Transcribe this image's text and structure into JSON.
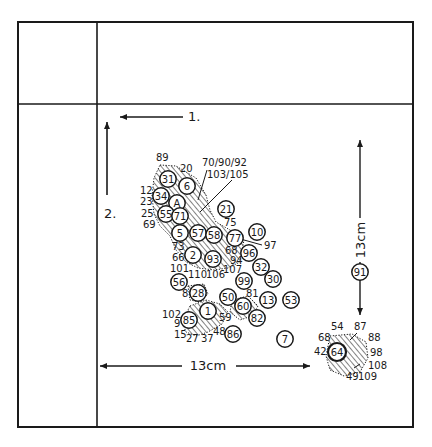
{
  "colors": {
    "ink": "#1a1a1a",
    "paper": "#ffffff"
  },
  "frame": {
    "outer": {
      "x": 18,
      "y": 22,
      "w": 395,
      "h": 405
    },
    "vertical_divider_x": 97,
    "horizontal_divider_y": 104
  },
  "axes": {
    "arrow_1": {
      "label": "1.",
      "x1": 183,
      "y1": 117,
      "x2": 120,
      "y2": 117,
      "lx": 188,
      "ly": 121
    },
    "arrow_2": {
      "label": "2.",
      "x1": 107,
      "y1": 195,
      "x2": 107,
      "y2": 122,
      "lx": 104,
      "ly": 218
    },
    "horizontal_scale": {
      "label": "13cm",
      "x1": 100,
      "x2": 310,
      "y": 366,
      "lx": 208,
      "ly": 370
    },
    "vertical_scale": {
      "label": "13cm",
      "x": 360,
      "y1": 140,
      "y2": 315,
      "lx": 365,
      "ly": 240
    }
  },
  "circled_points": [
    {
      "id": "31",
      "x": 168,
      "y": 179
    },
    {
      "id": "6",
      "x": 187,
      "y": 186
    },
    {
      "id": "34",
      "x": 161,
      "y": 196
    },
    {
      "id": "A",
      "x": 177,
      "y": 203
    },
    {
      "id": "55",
      "x": 166,
      "y": 214
    },
    {
      "id": "71",
      "x": 180,
      "y": 216
    },
    {
      "id": "21",
      "x": 226,
      "y": 209
    },
    {
      "id": "5",
      "x": 180,
      "y": 233
    },
    {
      "id": "57",
      "x": 198,
      "y": 233
    },
    {
      "id": "58",
      "x": 214,
      "y": 235
    },
    {
      "id": "77",
      "x": 235,
      "y": 238
    },
    {
      "id": "10",
      "x": 257,
      "y": 232
    },
    {
      "id": "2",
      "x": 193,
      "y": 255
    },
    {
      "id": "93",
      "x": 213,
      "y": 259
    },
    {
      "id": "96",
      "x": 249,
      "y": 253
    },
    {
      "id": "32",
      "x": 261,
      "y": 267
    },
    {
      "id": "30",
      "x": 273,
      "y": 279
    },
    {
      "id": "99",
      "x": 244,
      "y": 281
    },
    {
      "id": "56",
      "x": 179,
      "y": 282
    },
    {
      "id": "28",
      "x": 198,
      "y": 293
    },
    {
      "id": "50",
      "x": 228,
      "y": 297
    },
    {
      "id": "60",
      "x": 243,
      "y": 306
    },
    {
      "id": "13",
      "x": 268,
      "y": 300
    },
    {
      "id": "53",
      "x": 291,
      "y": 300
    },
    {
      "id": "1",
      "x": 208,
      "y": 311
    },
    {
      "id": "85",
      "x": 189,
      "y": 320
    },
    {
      "id": "82",
      "x": 257,
      "y": 318
    },
    {
      "id": "86",
      "x": 233,
      "y": 334
    },
    {
      "id": "7",
      "x": 285,
      "y": 339
    },
    {
      "id": "91",
      "x": 360,
      "y": 272
    },
    {
      "id": "64",
      "x": 337,
      "y": 352
    }
  ],
  "free_labels": [
    {
      "text": "89",
      "x": 156,
      "y": 161
    },
    {
      "text": "20",
      "x": 180,
      "y": 172
    },
    {
      "text": "70/90/92",
      "x": 202,
      "y": 166
    },
    {
      "text": "103/105",
      "x": 207,
      "y": 178
    },
    {
      "text": "12",
      "x": 140,
      "y": 194
    },
    {
      "text": "23",
      "x": 140,
      "y": 205
    },
    {
      "text": "25",
      "x": 141,
      "y": 217
    },
    {
      "text": "69",
      "x": 143,
      "y": 228
    },
    {
      "text": "75",
      "x": 224,
      "y": 226
    },
    {
      "text": "97",
      "x": 264,
      "y": 249
    },
    {
      "text": "73",
      "x": 172,
      "y": 250
    },
    {
      "text": "66",
      "x": 172,
      "y": 261
    },
    {
      "text": "68",
      "x": 225,
      "y": 254
    },
    {
      "text": "94",
      "x": 230,
      "y": 264
    },
    {
      "text": "101",
      "x": 170,
      "y": 272
    },
    {
      "text": "110",
      "x": 188,
      "y": 278
    },
    {
      "text": "106",
      "x": 206,
      "y": 278
    },
    {
      "text": "107",
      "x": 223,
      "y": 273
    },
    {
      "text": "8",
      "x": 182,
      "y": 297
    },
    {
      "text": "81",
      "x": 246,
      "y": 297
    },
    {
      "text": "102",
      "x": 162,
      "y": 318
    },
    {
      "text": "9",
      "x": 174,
      "y": 327
    },
    {
      "text": "59",
      "x": 219,
      "y": 321
    },
    {
      "text": "15",
      "x": 174,
      "y": 338
    },
    {
      "text": "27",
      "x": 186,
      "y": 342
    },
    {
      "text": "37",
      "x": 201,
      "y": 342
    },
    {
      "text": "48",
      "x": 213,
      "y": 335
    },
    {
      "text": "54",
      "x": 331,
      "y": 330
    },
    {
      "text": "87",
      "x": 354,
      "y": 330
    },
    {
      "text": "68",
      "x": 318,
      "y": 341
    },
    {
      "text": "88",
      "x": 368,
      "y": 341
    },
    {
      "text": "42",
      "x": 314,
      "y": 355
    },
    {
      "text": "98",
      "x": 370,
      "y": 356
    },
    {
      "text": "108",
      "x": 368,
      "y": 369
    },
    {
      "text": "49",
      "x": 346,
      "y": 380
    },
    {
      "text": "109",
      "x": 358,
      "y": 380
    }
  ],
  "leader_lines": [
    {
      "x1": 207,
      "y1": 170,
      "x2": 198,
      "y2": 200
    },
    {
      "x1": 232,
      "y1": 180,
      "x2": 200,
      "y2": 212
    },
    {
      "x1": 244,
      "y1": 240,
      "x2": 262,
      "y2": 245
    },
    {
      "x1": 357,
      "y1": 333,
      "x2": 350,
      "y2": 340
    },
    {
      "x1": 360,
      "y1": 364,
      "x2": 354,
      "y2": 368
    }
  ],
  "hatched_regions": [
    {
      "name": "main-cluster-upper",
      "points": "160,165 176,166 196,178 206,195 210,210 216,222 230,230 244,240 240,262 228,268 214,270 198,268 186,262 176,250 170,236 160,226 154,214 152,196 154,178"
    },
    {
      "name": "main-cluster-lower",
      "points": "190,306 206,300 220,304 228,312 222,324 208,332 196,336 186,332 182,322"
    },
    {
      "name": "cluster-60",
      "points": "232,300 248,296 258,306 252,316 240,320 230,312"
    },
    {
      "name": "cluster-28",
      "points": "188,286 204,284 208,294 200,302 190,300"
    },
    {
      "name": "cluster-64",
      "points": "330,336 352,334 366,342 368,358 360,372 344,376 330,370 326,356"
    }
  ]
}
